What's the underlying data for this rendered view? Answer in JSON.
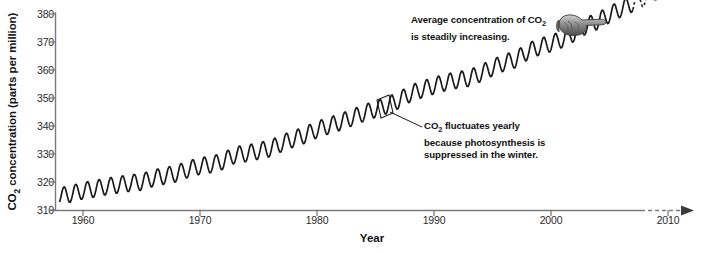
{
  "chart_data": {
    "type": "line",
    "title": "",
    "xlabel": "Year",
    "ylabel": "CO2 concentration (parts per million)",
    "ylabel_parts": {
      "prefix": "CO",
      "sub": "2",
      "suffix": " concentration (parts per million)"
    },
    "xlim": [
      1958,
      2011
    ],
    "ylim": [
      310,
      380
    ],
    "ytick_values": [
      310,
      320,
      330,
      340,
      350,
      360,
      370,
      380
    ],
    "ytick_labels": [
      "310",
      "320",
      "330",
      "340",
      "350",
      "360",
      "370",
      "380"
    ],
    "xtick_values": [
      1960,
      1970,
      1980,
      1990,
      2000,
      2010
    ],
    "xtick_labels": [
      "1960",
      "1970",
      "1980",
      "1990",
      "2000",
      "2010"
    ],
    "grid": false,
    "legend": "none",
    "series": [
      {
        "name": "Atmospheric CO2 (Mauna Loa)",
        "style": "solid",
        "color": "#1a1a1a",
        "description": "Annual sawtooth oscillation superimposed on a steadily rising trend",
        "seasonal_amplitude_ppm": 3.0,
        "x": [
          1958,
          1959,
          1960,
          1961,
          1962,
          1963,
          1964,
          1965,
          1966,
          1967,
          1968,
          1969,
          1970,
          1971,
          1972,
          1973,
          1974,
          1975,
          1976,
          1977,
          1978,
          1979,
          1980,
          1981,
          1982,
          1983,
          1984,
          1985,
          1986,
          1987,
          1988,
          1989,
          1990,
          1991,
          1992,
          1993,
          1994,
          1995,
          1996,
          1997,
          1998,
          1999,
          2000,
          2001,
          2002,
          2003,
          2004,
          2005,
          2006,
          2007
        ],
        "annual_mean": [
          315.0,
          315.8,
          316.9,
          317.6,
          318.4,
          319.0,
          319.6,
          320.0,
          321.4,
          322.2,
          323.0,
          324.6,
          325.7,
          326.3,
          327.5,
          329.7,
          330.2,
          331.1,
          332.0,
          333.8,
          335.4,
          336.8,
          338.7,
          340.1,
          341.4,
          343.0,
          344.6,
          346.0,
          347.4,
          349.2,
          351.6,
          353.1,
          354.4,
          355.6,
          356.4,
          357.1,
          358.8,
          360.8,
          362.6,
          363.8,
          366.6,
          368.3,
          369.5,
          371.0,
          373.2,
          375.8,
          377.5,
          379.8,
          381.9,
          383.8
        ]
      },
      {
        "name": "Projected continuation",
        "style": "dashed",
        "color": "#2b2b2b",
        "description": "Dashed extension of the sawtooth beyond the observed record",
        "x": [
          2007,
          2008,
          2009,
          2010
        ],
        "annual_mean": [
          383.8,
          385.8,
          387.8,
          389.6
        ]
      }
    ],
    "annotations": [
      {
        "id": "trend-callout",
        "line1_prefix": "Average concentration of CO",
        "line1_sub": "2",
        "line2": "is steadily increasing.",
        "icon": "pointing-hand-icon"
      },
      {
        "id": "seasonal-callout",
        "line1_prefix": "CO",
        "line1_sub": "2",
        "line1_suffix": " fluctuates yearly",
        "line2": "because photosynthesis is",
        "line3": "suppressed in the winter.",
        "marker": "highlight-box-on-one-cycle"
      }
    ]
  },
  "colors": {
    "axis": "#7a7a7a",
    "data": "#1a1a1a",
    "text": "#111111",
    "background": "#ffffff"
  }
}
